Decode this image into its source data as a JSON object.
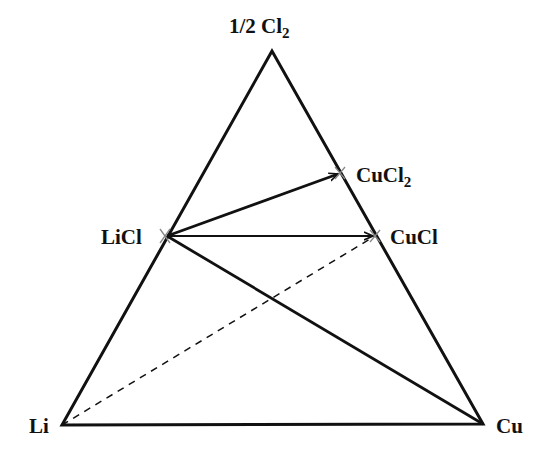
{
  "diagram": {
    "vertices": {
      "top": {
        "label": "1/2 Cl",
        "sub": "2",
        "x": 272,
        "y": 51
      },
      "left": {
        "label": "Li",
        "x": 62,
        "y": 425
      },
      "right": {
        "label": "Cu",
        "x": 483,
        "y": 424
      }
    },
    "points": {
      "licl": {
        "label": "LiCl",
        "x": 167,
        "y": 236
      },
      "cucl2": {
        "label": "CuCl",
        "sub": "2",
        "x": 340,
        "y": 173
      },
      "cucl": {
        "label": "CuCl",
        "x": 375,
        "y": 236
      }
    },
    "lines": [
      {
        "from": "licl",
        "to": "cucl2",
        "style": "solid-arrow"
      },
      {
        "from": "licl",
        "to": "cucl",
        "style": "solid-arrow-thin"
      },
      {
        "from": "licl",
        "to": "right",
        "style": "solid"
      },
      {
        "from": "left",
        "to": "cucl",
        "style": "dashed"
      }
    ],
    "colors": {
      "line": "#111111",
      "marker": "#888888"
    }
  }
}
